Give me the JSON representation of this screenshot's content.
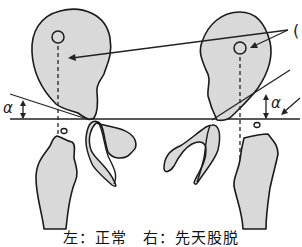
{
  "figure": {
    "type": "hip-radiograph-diagram",
    "angle_label_left": "α",
    "angle_label_right": "α",
    "pointer_label_partial": "(",
    "caption": "左：正常　右：先天股脱",
    "panels": [
      {
        "side": "left",
        "condition": "正常"
      },
      {
        "side": "right",
        "condition": "先天股脱"
      }
    ],
    "colors": {
      "bone_fill": "#d9d9d9",
      "outline": "#1a1a1a",
      "background": "#ffffff"
    }
  }
}
